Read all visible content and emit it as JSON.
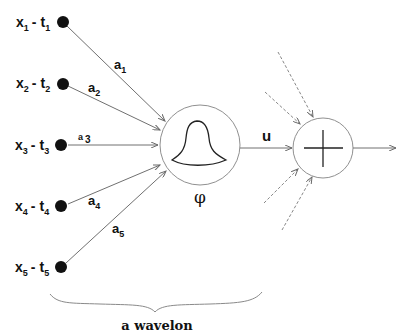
{
  "diagram": {
    "inputs": [
      {
        "x": "x",
        "xsub": "1",
        "t": "t",
        "tsub": "1",
        "weight": "a",
        "wsub": "1"
      },
      {
        "x": "x",
        "xsub": "2",
        "t": "t",
        "tsub": "2",
        "weight": "a",
        "wsub": "2"
      },
      {
        "x": "x",
        "xsub": "3",
        "t": "t",
        "tsub": "3",
        "weight": "a",
        "wsub": "3"
      },
      {
        "x": "x",
        "xsub": "4",
        "t": "t",
        "tsub": "4",
        "weight": "a",
        "wsub": "4"
      },
      {
        "x": "x",
        "xsub": "5",
        "t": "t",
        "tsub": "5",
        "weight": "a",
        "wsub": "5"
      }
    ],
    "separator": "-",
    "activation_label": "φ",
    "output_label": "u",
    "sum_node_symbol": "+",
    "caption": "a wavelon",
    "colors": {
      "line": "#6a6a6a",
      "node": "#111111",
      "circle": "#8a8a8a",
      "text": "#111111"
    }
  }
}
